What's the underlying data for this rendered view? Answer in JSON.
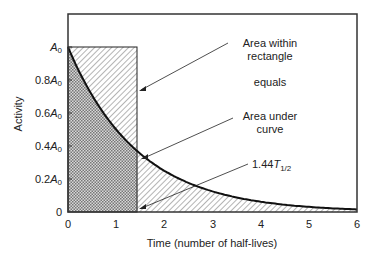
{
  "chart_data": {
    "type": "area",
    "title": "",
    "xlabel": "Time (number of  half-lives)",
    "ylabel": "Activity",
    "xlim": [
      0,
      6
    ],
    "ylim": [
      0,
      1.2
    ],
    "x_ticks": [
      "0",
      "1",
      "2",
      "3",
      "4",
      "5",
      "6"
    ],
    "y_ticks": [
      "0",
      "0.2A0",
      "0.4A0",
      "0.6A0",
      "0.8A0",
      "A0"
    ],
    "grid": false,
    "series": [
      {
        "name": "Activity decay A = A0 * 2^(-t)",
        "x": [
          0,
          0.5,
          1,
          1.44,
          2,
          3,
          4,
          5,
          6
        ],
        "values": [
          1.0,
          0.707,
          0.5,
          0.368,
          0.25,
          0.125,
          0.0625,
          0.031,
          0.016
        ]
      }
    ],
    "rectangle": {
      "x0": 0,
      "x1": 1.44,
      "height": 1.0
    },
    "annotations": [
      {
        "text": "Area within rectangle",
        "target": "rectangle"
      },
      {
        "text": "equals"
      },
      {
        "text": "Area under curve",
        "target": "curve"
      },
      {
        "text": "1.44T1/2",
        "target": "rectangle right edge on x-axis"
      }
    ]
  },
  "labels": {
    "ann1a": "Area within",
    "ann1b": "rectangle",
    "equals": "equals",
    "ann2a": "Area under",
    "ann2b": "curve",
    "ann3": "1.44",
    "ann3_T": "T",
    "ann3_sub": "1/2",
    "xlabel": "Time (number of  half-lives)",
    "ylabel": "Activity",
    "x_ticks": [
      "0",
      "1",
      "2",
      "3",
      "4",
      "5",
      "6"
    ],
    "y_ticks": [
      {
        "pre": "",
        "suf": "0"
      },
      {
        "pre": "0.2",
        "suf": "A"
      },
      {
        "pre": "0.4",
        "suf": "A"
      },
      {
        "pre": "0.6",
        "suf": "A"
      },
      {
        "pre": "0.8",
        "suf": "A"
      },
      {
        "pre": "",
        "suf": "A"
      }
    ],
    "sub0": "0"
  }
}
